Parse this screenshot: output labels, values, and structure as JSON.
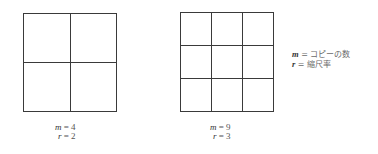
{
  "figures": [
    {
      "id": "left",
      "divisions": 2,
      "caption": {
        "m_var": "m",
        "m_eq": " = 4",
        "r_var": "r",
        "r_eq": " = 2"
      }
    },
    {
      "id": "right",
      "divisions": 3,
      "caption": {
        "m_var": "m",
        "m_eq": " = 9",
        "r_var": "r",
        "r_eq": " = 3"
      }
    }
  ],
  "legend": {
    "m_var": "m",
    "m_text": " = コピーの数",
    "r_var": "r",
    "r_text": " = 縮尺率"
  },
  "colors": {
    "line": "#3a3a3a",
    "text": "#555555",
    "background": "#ffffff"
  }
}
